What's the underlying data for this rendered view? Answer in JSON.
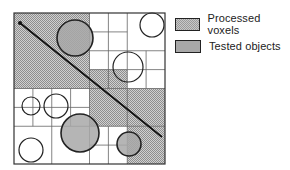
{
  "legend": {
    "items": [
      {
        "label": "Processed voxels",
        "style": "hatched",
        "color": "#b4b4b4"
      },
      {
        "label": "Tested objects",
        "style": "solid",
        "color": "#a8a8a8"
      }
    ]
  },
  "diagram": {
    "type": "quadtree-ray-traversal",
    "bounds": {
      "x": 14,
      "y": 13,
      "size": 151
    },
    "ray": {
      "x1": 20,
      "y1": 23,
      "x2": 162,
      "y2": 137
    },
    "processed_cells": [
      {
        "x": 14,
        "y": 13,
        "w": 75.5,
        "h": 75.5
      },
      {
        "x": 89.5,
        "y": 69.5,
        "w": 37.75,
        "h": 19
      },
      {
        "x": 89.5,
        "y": 88.5,
        "w": 75.5,
        "h": 37.75
      },
      {
        "x": 127.25,
        "y": 126.25,
        "w": 37.75,
        "h": 37.75
      }
    ],
    "tested_objects": [
      {
        "cx": 75,
        "cy": 38,
        "r": 18
      },
      {
        "cx": 80,
        "cy": 133,
        "r": 19
      },
      {
        "cx": 129,
        "cy": 144,
        "r": 12
      }
    ],
    "other_objects": [
      {
        "cx": 152,
        "cy": 25,
        "r": 12
      },
      {
        "cx": 128,
        "cy": 67,
        "r": 15
      },
      {
        "cx": 31,
        "cy": 106,
        "r": 9
      },
      {
        "cx": 56,
        "cy": 106,
        "r": 12
      },
      {
        "cx": 31,
        "cy": 150,
        "r": 12
      }
    ],
    "grid_lines": [
      [
        89.5,
        13,
        89.5,
        164
      ],
      [
        14,
        88.5,
        165,
        88.5
      ],
      [
        127.25,
        13,
        127.25,
        88.5
      ],
      [
        89.5,
        50.75,
        165,
        50.75
      ],
      [
        108.4,
        13,
        108.4,
        88.5
      ],
      [
        89.5,
        31.9,
        127.25,
        31.9
      ],
      [
        89.5,
        69.6,
        127.25,
        69.6
      ],
      [
        146.1,
        50.75,
        146.1,
        88.5
      ],
      [
        127.25,
        69.6,
        165,
        69.6
      ],
      [
        14,
        126.25,
        89.5,
        126.25
      ],
      [
        51.75,
        88.5,
        51.75,
        164
      ],
      [
        32.9,
        88.5,
        32.9,
        126.25
      ],
      [
        70.6,
        88.5,
        70.6,
        126.25
      ],
      [
        14,
        107.4,
        89.5,
        107.4
      ],
      [
        89.5,
        126.25,
        165,
        126.25
      ],
      [
        127.25,
        88.5,
        127.25,
        164
      ],
      [
        108.4,
        126.25,
        108.4,
        164
      ],
      [
        89.5,
        145.1,
        127.25,
        145.1
      ]
    ]
  }
}
